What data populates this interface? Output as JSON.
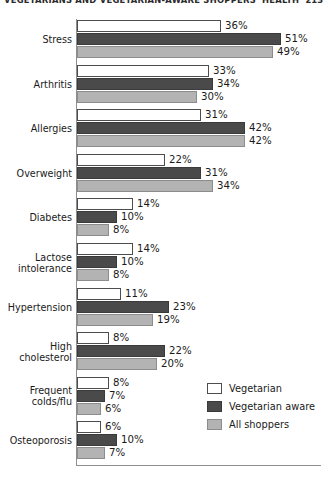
{
  "header": {
    "title": "VEGETARIANS AND VEGETARIAN-AWARE SHOPPERS' HEALTH",
    "page_number": "213"
  },
  "legend": {
    "position": "bottom-right",
    "items": [
      {
        "label": "Vegetarian",
        "color": "#ffffff",
        "swatch": "swatch-vegetarian"
      },
      {
        "label": "Vegetarian aware",
        "color": "#4a4a4a",
        "swatch": "swatch-vegetarian-aware"
      },
      {
        "label": "All shoppers",
        "color": "#b3b3b3",
        "swatch": "swatch-all-shoppers"
      }
    ]
  },
  "chart_data": {
    "type": "bar",
    "orientation": "horizontal",
    "title": "VEGETARIANS AND VEGETARIAN-AWARE SHOPPERS' HEALTH",
    "xlabel": "",
    "ylabel": "",
    "xlim": [
      0,
      55
    ],
    "grid": false,
    "value_suffix": "%",
    "legend_position": "bottom-right",
    "categories": [
      "Stress",
      "Arthritis",
      "Allergies",
      "Overweight",
      "Diabetes",
      "Lactose\nintolerance",
      "Hypertension",
      "High\ncholesterol",
      "Frequent\ncolds/flu",
      "Osteoporosis"
    ],
    "series": [
      {
        "name": "Vegetarian",
        "color": "#ffffff",
        "values": [
          36,
          33,
          31,
          22,
          14,
          14,
          11,
          8,
          8,
          6
        ],
        "labels": [
          "36%",
          "33%",
          "31%",
          "22%",
          "14%",
          "14%",
          "11%",
          "8%",
          "8%",
          "6%"
        ]
      },
      {
        "name": "Vegetarian aware",
        "color": "#4a4a4a",
        "values": [
          51,
          34,
          42,
          31,
          10,
          10,
          23,
          22,
          7,
          10
        ],
        "labels": [
          "51%",
          "34%",
          "42%",
          "31%",
          "10%",
          "10%",
          "23%",
          "22%",
          "7%",
          "10%"
        ]
      },
      {
        "name": "All shoppers",
        "color": "#b3b3b3",
        "values": [
          49,
          30,
          42,
          34,
          8,
          8,
          19,
          20,
          6,
          7
        ],
        "labels": [
          "49%",
          "30%",
          "42%",
          "34%",
          "8%",
          "8%",
          "19%",
          "20%",
          "6%",
          "7%"
        ]
      }
    ]
  }
}
